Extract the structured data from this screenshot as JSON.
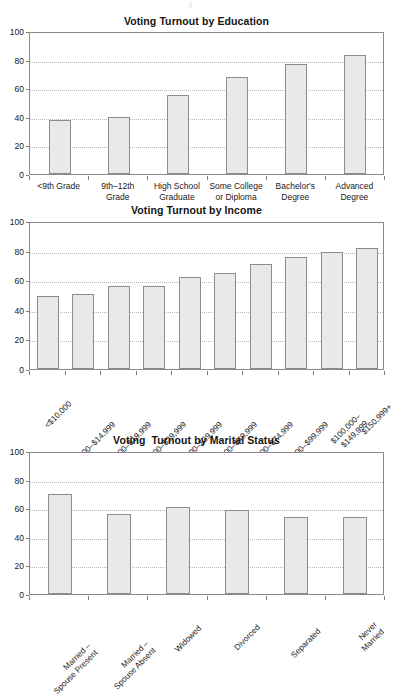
{
  "figure": {
    "panels": [
      "education",
      "income",
      "marital"
    ]
  },
  "axis": {
    "yticks": [
      0,
      20,
      40,
      60,
      80,
      100
    ],
    "ylim": [
      0,
      100
    ]
  },
  "chart_data": [
    {
      "type": "bar",
      "id": "education",
      "title": "Voting Turnout by Education",
      "xlabel": "",
      "ylabel": "",
      "ylim": [
        0,
        100
      ],
      "yticks": [
        0,
        20,
        40,
        60,
        80,
        100
      ],
      "grid": true,
      "legend": false,
      "categories": [
        "<9th Grade",
        "9th–12th\nGrade",
        "High School\nGraduate",
        "Some College\nor Diploma",
        "Bachelor's\nDegree",
        "Advanced\nDegree"
      ],
      "values": [
        38,
        40,
        55,
        68,
        77,
        83
      ]
    },
    {
      "type": "bar",
      "id": "income",
      "title": "Voting Turnout by Income",
      "xlabel": "",
      "ylabel": "",
      "ylim": [
        0,
        100
      ],
      "yticks": [
        0,
        20,
        40,
        60,
        80,
        100
      ],
      "grid": true,
      "legend": false,
      "categories": [
        "<$10,000",
        "$10,000–$14,999",
        "$15,000–$19,999",
        "$20,000–$29,999",
        "$30,000–$39,999",
        "$40,000–$49,999",
        "$50,000–$74,999",
        "$75,000–$99,999",
        "$100,000–$149,999",
        "$150,999+"
      ],
      "values": [
        49,
        51,
        56,
        56,
        62,
        65,
        71,
        76,
        79,
        82
      ]
    },
    {
      "type": "bar",
      "id": "marital",
      "title": "Voting  Turnout by Marital Status",
      "xlabel": "",
      "ylabel": "",
      "ylim": [
        0,
        100
      ],
      "yticks": [
        0,
        20,
        40,
        60,
        80,
        100
      ],
      "grid": true,
      "legend": false,
      "categories": [
        "Married –\nSpouse Present",
        "Married –\nSpouse Absent",
        "Widowed",
        "Divorced",
        "Separated",
        "Never Married"
      ],
      "values": [
        70,
        56,
        61,
        59,
        54,
        54
      ]
    }
  ],
  "colors": {
    "bar_fill": "#e9e9e9",
    "bar_border": "#8d8d8d",
    "frame": "#8a8a8a",
    "gridline": "#b9b9b9",
    "text": "#1a1a1a"
  }
}
